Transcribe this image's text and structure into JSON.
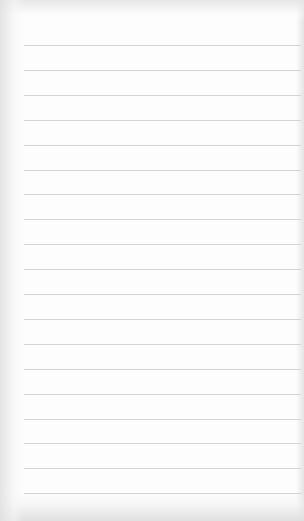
{
  "paper": {
    "type": "lined-notepad",
    "background_color": "#fdfdfd",
    "rule_color": "#d4d4d4",
    "rule_left_px": 24,
    "first_rule_y": 45,
    "rule_spacing_px": 24.9,
    "rule_count": 19
  }
}
